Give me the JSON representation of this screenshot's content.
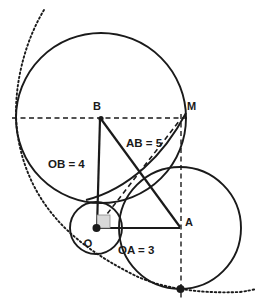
{
  "figure": {
    "background_color": "#ffffff",
    "ink_color": "#1a1a1a",
    "width": 258,
    "height": 307
  },
  "labels": {
    "point_b": "B",
    "point_m": "M",
    "point_a": "A",
    "point_o": "O",
    "seg_ob": "OB = 4",
    "seg_ab": "AB = 5",
    "seg_oa": "OA = 3"
  },
  "points": [
    {
      "name": "O",
      "label": "O",
      "x": 96,
      "y": 228,
      "marked": true
    },
    {
      "name": "B",
      "label": "B",
      "x": 101,
      "y": 118,
      "marked": true
    },
    {
      "name": "A",
      "label": "A",
      "x": 180,
      "y": 228,
      "marked": false
    },
    {
      "name": "M",
      "label": "M",
      "x": 185,
      "y": 118,
      "marked": false
    },
    {
      "name": "T",
      "label": "",
      "x": 180,
      "y": 289,
      "marked": true
    }
  ],
  "circles": [
    {
      "name": "circle-B",
      "center": "B",
      "cx": 101,
      "cy": 118,
      "r": 85,
      "style": "solid"
    },
    {
      "name": "circle-O",
      "center": "O",
      "cx": 96,
      "cy": 228,
      "r": 26,
      "style": "solid"
    },
    {
      "name": "circle-A",
      "center": "A",
      "cx": 180,
      "cy": 228,
      "r": 61,
      "style": "solid"
    }
  ],
  "segments": [
    {
      "name": "OB",
      "from": "O",
      "to": "B",
      "style": "solid",
      "label": "OB = 4"
    },
    {
      "name": "OA",
      "from": "O",
      "to": "A",
      "style": "solid",
      "label": "OA = 3"
    },
    {
      "name": "AB",
      "from": "A",
      "to": "B",
      "style": "solid",
      "label": "AB = 5"
    },
    {
      "name": "OM",
      "from": "O",
      "to": "M",
      "style": "dashed",
      "label": ""
    },
    {
      "name": "BM",
      "from": "B",
      "to": "M",
      "style": "dashed",
      "label": ""
    },
    {
      "name": "AM-vertical",
      "from": "M",
      "to": "T",
      "style": "dashed",
      "label": ""
    }
  ],
  "arcs": [
    {
      "name": "enveloping-dotted-arc",
      "style": "dotted"
    },
    {
      "name": "inner-tangent-arc",
      "style": "solid"
    }
  ],
  "markers": {
    "right_angle_at_o": true,
    "right_angle_size": 13
  }
}
